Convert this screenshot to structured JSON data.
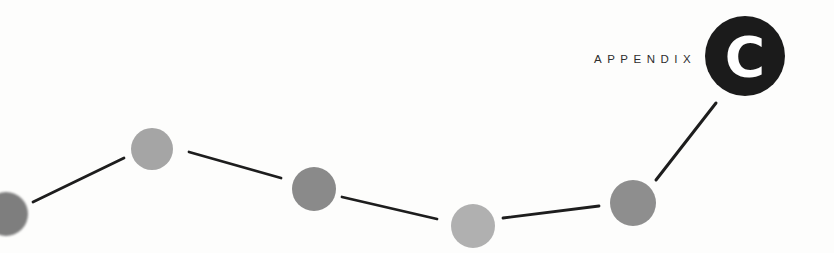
{
  "page": {
    "background": "#fdfdfc"
  },
  "header": {
    "label": "APPENDIX",
    "label_color": "#2e2e2e",
    "letter": "C",
    "letter_color": "#ffffff",
    "badge_color": "#1b1b1b"
  },
  "decoration": {
    "line_color": "#1d1d1d",
    "dots": [
      {
        "id": "dot-1",
        "color": "#7e7e7e"
      },
      {
        "id": "dot-2",
        "color": "#a5a5a5"
      },
      {
        "id": "dot-3",
        "color": "#8a8a8a"
      },
      {
        "id": "dot-4",
        "color": "#b0b0b0"
      },
      {
        "id": "dot-5",
        "color": "#8e8e8e"
      }
    ]
  }
}
